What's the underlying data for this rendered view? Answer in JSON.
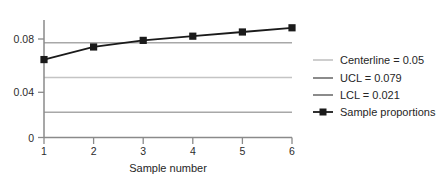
{
  "chart_data": {
    "type": "line",
    "title": "",
    "subtitle": "",
    "xlabel": "Sample number",
    "ylabel": "",
    "x": [
      1,
      2,
      3,
      4,
      5,
      6
    ],
    "xtick_labels": [
      "1",
      "2",
      "3",
      "4",
      "5",
      "6"
    ],
    "ytick_labels": [
      "0",
      "0.04",
      "0.08"
    ],
    "ytick_values": [
      0,
      0.04,
      0.08
    ],
    "xlim": [
      1,
      6
    ],
    "ylim": [
      0,
      0.098
    ],
    "grid": false,
    "legend_position": "right",
    "series": [
      {
        "name": "Sample proportions",
        "type": "line-marker",
        "marker": "square",
        "color": "#1a1a1a",
        "values": [
          0.065,
          0.0755,
          0.081,
          0.0845,
          0.088,
          0.0915
        ]
      }
    ],
    "reference_lines": [
      {
        "name": "Centerline",
        "label": "Centerline = 0.05",
        "value": 0.05,
        "color": "#b9b9b9"
      },
      {
        "name": "UCL",
        "label": "UCL = 0.079",
        "value": 0.079,
        "color": "#a8a8a8"
      },
      {
        "name": "LCL",
        "label": "LCL = 0.021",
        "value": 0.021,
        "color": "#a8a8a8"
      }
    ]
  },
  "axis": {
    "x_title": "Sample number",
    "ticks_x": {
      "t1": "1",
      "t2": "2",
      "t3": "3",
      "t4": "4",
      "t5": "5",
      "t6": "6"
    },
    "ticks_y": {
      "t0": "0",
      "t1": "0.04",
      "t2": "0.08"
    }
  },
  "legend": {
    "items": [
      {
        "label": "Centerline = 0.05",
        "swatch": "line",
        "color": "#c2c2c2"
      },
      {
        "label": "UCL = 0.079",
        "swatch": "line",
        "color": "#6e6e6e"
      },
      {
        "label": "LCL = 0.021",
        "swatch": "line",
        "color": "#6e6e6e"
      },
      {
        "label": "Sample proportions",
        "swatch": "line-marker",
        "color": "#1a1a1a"
      }
    ]
  },
  "colors": {
    "background": "#ffffff",
    "axis": "#8a8a8a",
    "text": "#262626",
    "series": "#1a1a1a",
    "centerline": "#b9b9b9",
    "control_limit": "#a8a8a8",
    "legend_dark": "#6e6e6e",
    "legend_light": "#c2c2c2"
  }
}
